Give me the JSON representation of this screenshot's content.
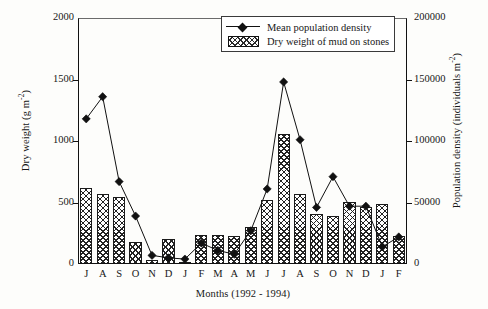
{
  "chart_data": {
    "type": "bar",
    "title": "",
    "xlabel": "Months (1992 - 1994)",
    "ylabel": "Dry weight (g m-2)",
    "ylabel_right": "Population density (individuals m-2)",
    "categories": [
      "J",
      "A",
      "S",
      "O",
      "N",
      "D",
      "J",
      "F",
      "M",
      "A",
      "M",
      "J",
      "J",
      "A",
      "S",
      "O",
      "N",
      "D",
      "J",
      "F"
    ],
    "ylim": [
      0,
      2000
    ],
    "ylim_right": [
      0,
      200000
    ],
    "yticks": [
      0,
      500,
      1000,
      1500,
      2000
    ],
    "yticks_right": [
      0,
      50000,
      100000,
      150000,
      200000
    ],
    "grid": false,
    "legend_position": "top-right",
    "series": [
      {
        "name": "Dry weight of mud on stones",
        "kind": "bar",
        "axis": "left",
        "unit": "g m-2",
        "values": [
          615,
          570,
          545,
          175,
          30,
          205,
          20,
          235,
          235,
          225,
          300,
          520,
          1055,
          570,
          405,
          390,
          505,
          460,
          490,
          230
        ]
      },
      {
        "name": "Mean population density",
        "kind": "line",
        "axis": "right",
        "unit": "individuals m-2",
        "values": [
          118000,
          136000,
          67000,
          39000,
          7000,
          5000,
          4000,
          17000,
          11000,
          8000,
          27000,
          61000,
          148000,
          101000,
          46000,
          71000,
          47000,
          47000,
          14000,
          22000
        ]
      }
    ]
  },
  "axes": {
    "left_title_main": "Dry weight (g m",
    "left_title_sup": "-2",
    "left_title_end": ")",
    "right_title_main": "Population density (individuals m",
    "right_title_sup": "-2",
    "right_title_end": ")",
    "x_title": "Months (1992 - 1994)"
  },
  "legend": {
    "entries": [
      {
        "label": "Mean population density",
        "key": "line-diamond-marker"
      },
      {
        "label": "Dry weight of mud on stones",
        "key": "crosshatch-swatch"
      }
    ]
  },
  "colors": {
    "ink": "#111111",
    "background": "#fdfdfb",
    "hatch": "#232323"
  }
}
